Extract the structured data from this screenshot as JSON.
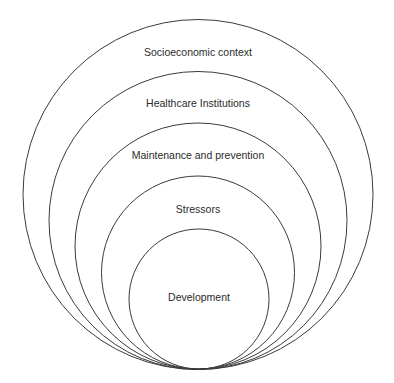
{
  "diagram": {
    "type": "nested-circles",
    "stroke_color": "#3a3a3a",
    "text_color": "#2b2b2b",
    "background": "#ffffff",
    "layers": [
      {
        "label": "Socioeconomic context",
        "cx": 198,
        "cy": 194.5,
        "r": 175,
        "label_y": 53
      },
      {
        "label": "Healthcare Institutions",
        "cx": 198,
        "cy": 220.5,
        "r": 149,
        "label_y": 104
      },
      {
        "label": "Maintenance and prevention",
        "cx": 198,
        "cy": 246,
        "r": 123,
        "label_y": 156
      },
      {
        "label": "Stressors",
        "cx": 198,
        "cy": 272.5,
        "r": 96.5,
        "label_y": 210
      },
      {
        "label": "Development",
        "cx": 199,
        "cy": 299,
        "r": 70,
        "label_y": 298
      }
    ]
  }
}
